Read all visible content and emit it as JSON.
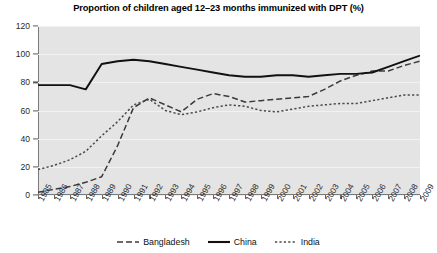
{
  "chart_data": {
    "type": "line",
    "title": "Proportion of children aged 12–23 months immunized with DPT (%)",
    "xlabel": "",
    "ylabel": "",
    "ylim": [
      0,
      120
    ],
    "ytick_step": 20,
    "yticks": [
      "0",
      "20",
      "40",
      "60",
      "80",
      "100",
      "120"
    ],
    "grid": true,
    "legend_position": "bottom-center",
    "categories": [
      "1985",
      "1986",
      "1987",
      "1988",
      "1989",
      "1990",
      "1991",
      "1992",
      "1993",
      "1994",
      "1995",
      "1996",
      "1997",
      "1998",
      "1999",
      "2000",
      "2001",
      "2002",
      "2003",
      "2004",
      "2005",
      "2006",
      "2007",
      "2008",
      "2009"
    ],
    "series": [
      {
        "name": "Bangladesh",
        "style": "dashed",
        "color": "#3a3a3a",
        "values": [
          2,
          4,
          6,
          9,
          13,
          35,
          62,
          69,
          64,
          59,
          68,
          72,
          70,
          66,
          67,
          68,
          69,
          70,
          75,
          81,
          85,
          88,
          88,
          92,
          95
        ]
      },
      {
        "name": "China",
        "style": "solid",
        "color": "#111111",
        "values": [
          78,
          78,
          78,
          75,
          93,
          95,
          96,
          95,
          93,
          91,
          89,
          87,
          85,
          84,
          84,
          85,
          85,
          84,
          85,
          86,
          86,
          87,
          91,
          95,
          99
        ]
      },
      {
        "name": "India",
        "style": "dotted",
        "color": "#4a4a4a",
        "values": [
          18,
          21,
          25,
          31,
          42,
          52,
          64,
          68,
          60,
          57,
          59,
          62,
          64,
          63,
          60,
          59,
          61,
          63,
          64,
          65,
          65,
          67,
          69,
          71,
          71
        ]
      }
    ]
  },
  "legend": {
    "items": [
      {
        "label": "Bangladesh"
      },
      {
        "label": "China"
      },
      {
        "label": "India"
      }
    ]
  }
}
